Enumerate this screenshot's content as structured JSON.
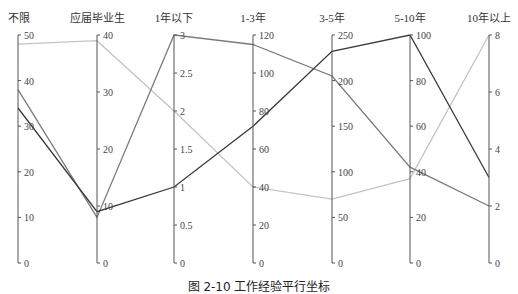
{
  "chart_data": {
    "type": "parallel-coordinates",
    "title": "",
    "caption": "图 2-10  工作经验平行坐标",
    "dimensions": [
      {
        "name": "不限",
        "min": 0,
        "max": 50,
        "ticks": [
          0,
          10,
          20,
          30,
          40,
          50
        ]
      },
      {
        "name": "应届毕业生",
        "min": 0,
        "max": 40,
        "ticks": [
          0,
          10,
          20,
          30,
          40
        ]
      },
      {
        "name": "1年以下",
        "min": 0,
        "max": 3,
        "ticks": [
          0,
          0.5,
          1,
          1.5,
          2,
          2.5,
          3
        ]
      },
      {
        "name": "1-3年",
        "min": 0,
        "max": 120,
        "ticks": [
          0,
          20,
          40,
          60,
          80,
          100,
          120
        ]
      },
      {
        "name": "3-5年",
        "min": 0,
        "max": 250,
        "ticks": [
          0,
          50,
          100,
          150,
          200,
          250
        ]
      },
      {
        "name": "5-10年",
        "min": 0,
        "max": 100,
        "ticks": [
          0,
          20,
          40,
          60,
          80,
          100
        ]
      },
      {
        "name": "10年以上",
        "min": 0,
        "max": 8,
        "ticks": [
          0,
          2,
          4,
          6,
          8
        ]
      }
    ],
    "series": [
      {
        "name": "series-dark",
        "color": "#3a3a3a",
        "values": [
          34,
          9,
          1,
          72,
          232,
          100,
          3
        ]
      },
      {
        "name": "series-mid",
        "color": "#7a7a7a",
        "values": [
          38,
          8,
          3,
          115,
          205,
          42,
          2
        ]
      },
      {
        "name": "series-light",
        "color": "#c4c4c4",
        "values": [
          48,
          39,
          2,
          40,
          70,
          37,
          8
        ]
      }
    ],
    "layout": {
      "grid": false,
      "legend": "none"
    }
  }
}
